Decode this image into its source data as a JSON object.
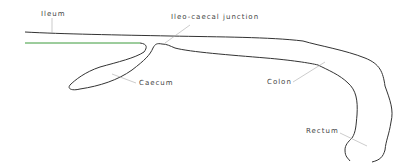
{
  "diagram": {
    "type": "anatomical-line-drawing",
    "labels": [
      {
        "id": "ileum",
        "text": "Ileum"
      },
      {
        "id": "ileo_caecal_junction",
        "text": "Ileo-caecal junction"
      },
      {
        "id": "caecum",
        "text": "Caecum"
      },
      {
        "id": "colon",
        "text": "Colon"
      },
      {
        "id": "rectum",
        "text": "Rectum"
      }
    ],
    "colors": {
      "outline": "#333333",
      "ileum_lower_wall": "#3a9a3a",
      "leader_line": "#aaaaaa",
      "label_text": "#444444"
    }
  }
}
